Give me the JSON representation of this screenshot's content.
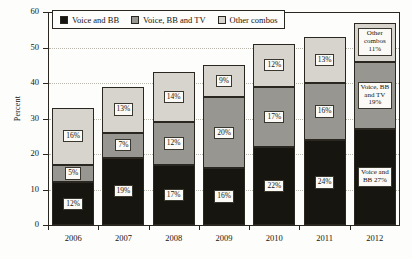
{
  "chart_data": {
    "type": "bar",
    "subtype": "stacked-bar",
    "title": "",
    "xlabel": "",
    "ylabel": "Percent",
    "ylim": [
      0,
      60
    ],
    "ytick_values": [
      0,
      10,
      20,
      30,
      40,
      50,
      60
    ],
    "ytick_labels": [
      "0",
      "10",
      "20",
      "30",
      "40",
      "50",
      "60"
    ],
    "grid": "horizontal-dotted",
    "legend_position": "top-left-inside",
    "categories": [
      "2006",
      "2007",
      "2008",
      "2009",
      "2010",
      "2011",
      "2012"
    ],
    "series": [
      {
        "name": "Voice and BB",
        "color": "#17150f",
        "values": [
          12,
          19,
          17,
          16,
          22,
          24,
          27
        ],
        "labels": [
          "12%",
          "19%",
          "17%",
          "16%",
          "22%",
          "24%",
          "27%"
        ]
      },
      {
        "name": "Voice, BB and TV",
        "color": "#989690",
        "values": [
          5,
          7,
          12,
          20,
          17,
          16,
          19
        ],
        "labels": [
          "5%",
          "7%",
          "12%",
          "20%",
          "17%",
          "16%",
          "19%"
        ]
      },
      {
        "name": "Other combos",
        "color": "#d6d4cd",
        "values": [
          16,
          13,
          14,
          9,
          12,
          13,
          11
        ],
        "labels": [
          "16%",
          "13%",
          "14%",
          "9%",
          "12%",
          "13%",
          "11%"
        ]
      }
    ],
    "totals": [
      33,
      39,
      43,
      45,
      51,
      53,
      57
    ],
    "annotations": {
      "final_bar_year": "2012",
      "final_bar_labels": [
        "Voice and BB 27%",
        "Voice, BB and TV 19%",
        "Other combos 11%"
      ]
    }
  },
  "legend": {
    "items": [
      {
        "label": "Voice and BB",
        "color": "#17150f"
      },
      {
        "label": "Voice, BB and TV",
        "color": "#989690"
      },
      {
        "label": "Other combos",
        "color": "#d6d4cd"
      }
    ]
  },
  "final_bar_text": {
    "other": "Other combos 11%",
    "other_line1": "Other",
    "other_line2": "combos",
    "other_line3": "11%",
    "triple_line1": "Voice,",
    "triple_line2": "BB and",
    "triple_line3": "TV",
    "triple_line4": "19%",
    "voice_line1": "Voice",
    "voice_line2": "and BB",
    "voice_line3": "27%"
  }
}
